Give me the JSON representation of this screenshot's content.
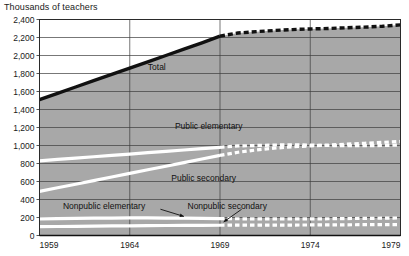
{
  "chart_data": {
    "type": "line",
    "title": "Thousands of teachers",
    "subtitle": "",
    "xlabel": "",
    "ylabel": "Thousands of teachers",
    "xlim": [
      1959,
      1979
    ],
    "ylim": [
      0,
      2400
    ],
    "grid": true,
    "legend_position": "inline-labels",
    "x_ticks": [
      "1959",
      "1964",
      "1969",
      "1974",
      "1979"
    ],
    "x_tick_values": [
      1959,
      1964,
      1969,
      1974,
      1979
    ],
    "y_ticks": [
      "0",
      "200",
      "400",
      "600",
      "800",
      "1,000",
      "1,200",
      "1,400",
      "1,600",
      "1,800",
      "2,000",
      "2,200",
      "2,400"
    ],
    "y_tick_values": [
      0,
      200,
      400,
      600,
      800,
      1000,
      1200,
      1400,
      1600,
      1800,
      2000,
      2200,
      2400
    ],
    "projection_start_year": 1969,
    "annotations": [
      {
        "text": "Total",
        "x": 1965.0,
        "y": 1840
      },
      {
        "text": "Public elementary",
        "x": 1966.5,
        "y": 1180
      },
      {
        "text": "Public secondary",
        "x": 1966.3,
        "y": 610
      },
      {
        "text": "Nonpublic elementary",
        "x": 1960.3,
        "y": 300
      },
      {
        "text": "Nonpublic secondary",
        "x": 1967.2,
        "y": 300
      }
    ],
    "x": [
      1959,
      1960,
      1961,
      1962,
      1963,
      1964,
      1965,
      1966,
      1967,
      1968,
      1969,
      1970,
      1971,
      1972,
      1973,
      1974,
      1975,
      1976,
      1977,
      1978,
      1979
    ],
    "series": [
      {
        "name": "Total",
        "style": "solid-black-then-dashed",
        "color": "#111111",
        "values": [
          1510,
          1580,
          1650,
          1720,
          1790,
          1860,
          1930,
          2000,
          2070,
          2140,
          2215,
          2250,
          2265,
          2278,
          2288,
          2295,
          2300,
          2308,
          2315,
          2325,
          2340
        ]
      },
      {
        "name": "Public elementary",
        "style": "solid-white-then-dashed",
        "color": "#ffffff",
        "values": [
          830,
          845,
          860,
          875,
          890,
          905,
          920,
          935,
          950,
          965,
          980,
          995,
          1000,
          1005,
          1008,
          1005,
          1000,
          998,
          998,
          1000,
          1005
        ]
      },
      {
        "name": "Public secondary",
        "style": "solid-white-then-dashed",
        "color": "#ffffff",
        "values": [
          490,
          530,
          570,
          610,
          650,
          690,
          730,
          770,
          810,
          850,
          890,
          925,
          950,
          970,
          985,
          995,
          1005,
          1015,
          1025,
          1035,
          1045
        ]
      },
      {
        "name": "Nonpublic elementary",
        "style": "solid-white-then-dashed",
        "color": "#ffffff",
        "values": [
          185,
          188,
          190,
          192,
          194,
          195,
          195,
          194,
          192,
          190,
          188,
          186,
          185,
          184,
          184,
          185,
          186,
          188,
          190,
          192,
          195
        ]
      },
      {
        "name": "Nonpublic secondary",
        "style": "solid-white-then-dashed",
        "color": "#ffffff",
        "values": [
          98,
          100,
          102,
          104,
          106,
          108,
          110,
          111,
          112,
          113,
          114,
          115,
          115,
          116,
          116,
          117,
          118,
          119,
          120,
          121,
          122
        ]
      }
    ]
  }
}
